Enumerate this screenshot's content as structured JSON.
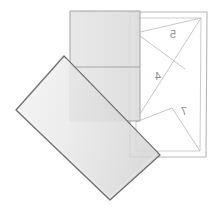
{
  "canvas": {
    "width": 217,
    "height": 210,
    "background": "#ffffff"
  },
  "scene": {
    "title": "folded-paper-overlap-diagram",
    "description": "Three overlapping translucent quadrilaterals: a bordered white page with mirrored numerals, an upright grey rectangle, and a rotated grey rectangle."
  },
  "page": {
    "name": "bordered-page",
    "outer_frame": {
      "points": "130,12 207,12 206,157 130,157",
      "stroke": "#b5b5b5",
      "fill": "#ffffff"
    },
    "inner_frame": {
      "points": "136,18 201,18 200,151 136,151",
      "stroke": "#c9c9c9",
      "fill": "#ffffff"
    },
    "creases": [
      {
        "name": "crease-upper",
        "points": "136,33 201,18"
      },
      {
        "name": "crease-mid",
        "points": "136,33 185,69"
      },
      {
        "name": "crease-diagonal",
        "points": "201,18 138,117"
      },
      {
        "name": "crease-lower",
        "points": "136,122 172,108"
      },
      {
        "name": "crease-lower-right",
        "points": "172,108 200,151"
      }
    ],
    "labels": [
      {
        "name": "label-5",
        "text": "5",
        "x": 173,
        "y": 38,
        "mirrored": true
      },
      {
        "name": "label-4",
        "text": "4",
        "x": 158,
        "y": 80,
        "mirrored": true
      },
      {
        "name": "label-7",
        "text": "7",
        "x": 184,
        "y": 115,
        "mirrored": true
      }
    ]
  },
  "upright_rect": {
    "name": "upright-grey-rectangle",
    "points": "70,11 140,11 140,121 70,121",
    "fill": "#e3e3e3",
    "stroke": "#9a9a9a",
    "opacity": 0.82
  },
  "rotated_rect": {
    "name": "rotated-grey-rectangle",
    "points": "64,56 160,155 110,200 16,110",
    "fill_start": "#f2f2f2",
    "fill_end": "#d8d8d8",
    "stroke": "#6e6e6e",
    "opacity": 0.9
  },
  "overlap": {
    "name": "overlap-shading",
    "fill": "#c2c2c2",
    "note": "darker region where the upright and rotated rectangles intersect"
  },
  "colors": {
    "paper_white": "#ffffff",
    "light_grey": "#e3e3e3",
    "mid_grey": "#c2c2c2",
    "line_grey": "#b5b5b5",
    "dark_outline": "#6e6e6e",
    "numeral_grey": "#8c8c8c"
  }
}
